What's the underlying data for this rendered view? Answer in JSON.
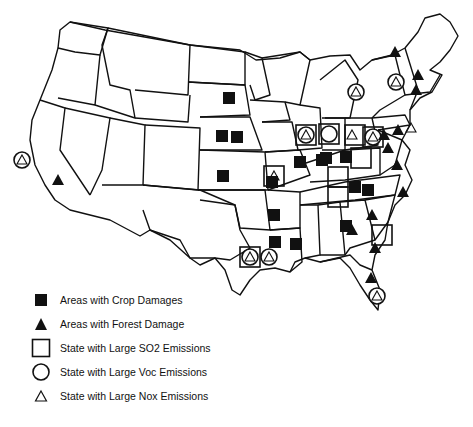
{
  "map": {
    "title": "",
    "region": "Contiguous United States",
    "stroke_color": "#111111",
    "fill_color": "#ffffff"
  },
  "legend": {
    "items": [
      {
        "symbol": "filled-square",
        "label": "Areas with Crop Damages"
      },
      {
        "symbol": "filled-triangle",
        "label": "Areas with Forest Damage"
      },
      {
        "symbol": "open-square",
        "label": "State with Large SO2 Emissions"
      },
      {
        "symbol": "open-circle",
        "label": "State with Large Voc Emissions"
      },
      {
        "symbol": "open-triangle",
        "label": "State with Large Nox Emissions"
      }
    ]
  },
  "markers": {
    "crop_damage": [
      [
        222,
        136
      ],
      [
        223,
        176
      ],
      [
        229,
        98
      ],
      [
        237,
        137
      ],
      [
        272,
        182
      ],
      [
        274,
        215
      ],
      [
        275,
        242
      ],
      [
        296,
        244
      ],
      [
        300,
        162
      ],
      [
        322,
        160
      ],
      [
        326,
        158
      ],
      [
        346,
        157
      ],
      [
        346,
        226
      ],
      [
        355,
        187
      ],
      [
        368,
        190
      ]
    ],
    "forest_damage": [
      [
        58,
        180
      ],
      [
        395,
        52
      ],
      [
        418,
        75
      ],
      [
        416,
        90
      ],
      [
        398,
        130
      ],
      [
        384,
        135
      ],
      [
        388,
        148
      ],
      [
        397,
        165
      ],
      [
        403,
        192
      ],
      [
        372,
        215
      ],
      [
        352,
        230
      ],
      [
        375,
        248
      ],
      [
        371,
        278
      ]
    ],
    "so2_emissions": [
      [
        306,
        135
      ],
      [
        329,
        134
      ],
      [
        355,
        135
      ],
      [
        373,
        137
      ],
      [
        361,
        158
      ],
      [
        338,
        177
      ],
      [
        338,
        197
      ],
      [
        382,
        235
      ],
      [
        250,
        257
      ],
      [
        274,
        176
      ]
    ],
    "voc_emissions": [
      [
        22,
        160
      ],
      [
        250,
        257
      ],
      [
        269,
        257
      ],
      [
        306,
        135
      ],
      [
        329,
        134
      ],
      [
        356,
        92
      ],
      [
        373,
        137
      ],
      [
        396,
        82
      ],
      [
        377,
        296
      ]
    ],
    "nox_emissions": [
      [
        22,
        160
      ],
      [
        250,
        257
      ],
      [
        269,
        257
      ],
      [
        306,
        135
      ],
      [
        356,
        92
      ],
      [
        352,
        135
      ],
      [
        373,
        137
      ],
      [
        396,
        82
      ],
      [
        411,
        128
      ],
      [
        274,
        176
      ],
      [
        377,
        296
      ]
    ]
  }
}
